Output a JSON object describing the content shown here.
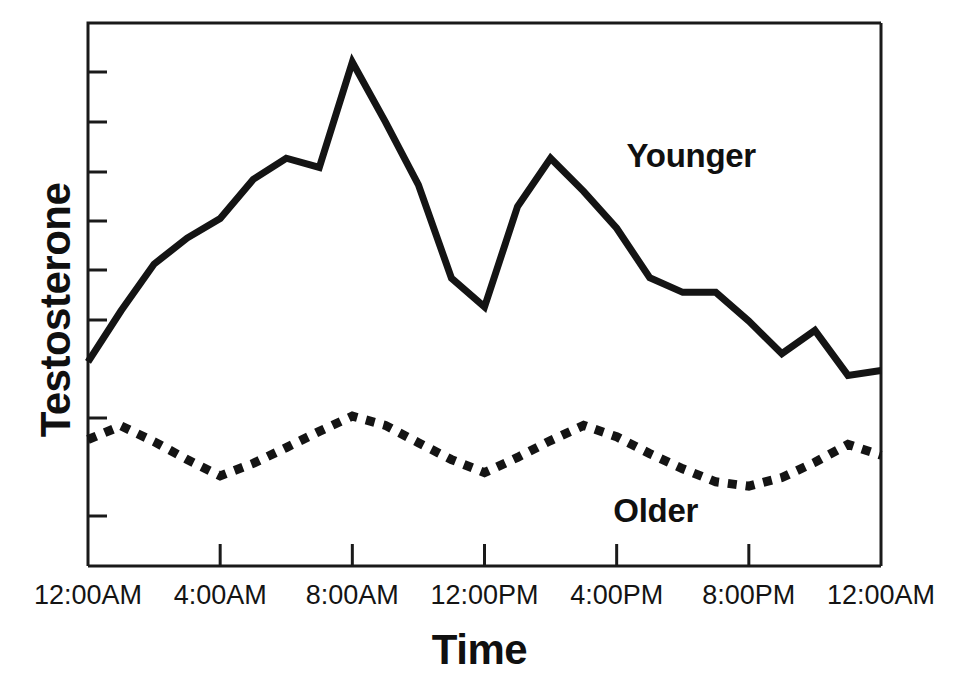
{
  "chart_data": {
    "type": "line",
    "title": "",
    "xlabel": "Time",
    "ylabel": "Testosterone",
    "grid": false,
    "legend_position": "inline-annotation",
    "x_tick_labels": [
      "12:00AM",
      "4:00AM",
      "8:00AM",
      "12:00PM",
      "4:00PM",
      "8:00PM",
      "12:00AM"
    ],
    "x_tick_hours": [
      0,
      4,
      8,
      12,
      16,
      20,
      24
    ],
    "xlim_hours": [
      0,
      24
    ],
    "y_axis_labeled": false,
    "y_tick_count": 8,
    "ylim": [
      0,
      1
    ],
    "series": [
      {
        "name": "Younger",
        "style": "solid",
        "color": "#141414",
        "x_hours": [
          0,
          1,
          2,
          3,
          4,
          5,
          6,
          7,
          8,
          9,
          10,
          11,
          12,
          13,
          14,
          15,
          16,
          17,
          18,
          19,
          20,
          21,
          22,
          23,
          24
        ],
        "values": [
          0.376,
          0.47,
          0.556,
          0.604,
          0.64,
          0.712,
          0.751,
          0.734,
          0.928,
          0.818,
          0.702,
          0.53,
          0.477,
          0.662,
          0.751,
          0.69,
          0.622,
          0.531,
          0.504,
          0.504,
          0.451,
          0.391,
          0.434,
          0.351,
          0.36
        ]
      },
      {
        "name": "Older",
        "style": "dotted",
        "color": "#141414",
        "x_hours": [
          0,
          1,
          2,
          3,
          4,
          5,
          6,
          7,
          8,
          9,
          10,
          11,
          12,
          13,
          14,
          15,
          16,
          17,
          18,
          19,
          20,
          21,
          22,
          23,
          24
        ],
        "values": [
          0.233,
          0.258,
          0.229,
          0.196,
          0.166,
          0.189,
          0.218,
          0.248,
          0.276,
          0.259,
          0.227,
          0.196,
          0.172,
          0.2,
          0.231,
          0.259,
          0.238,
          0.207,
          0.179,
          0.155,
          0.147,
          0.163,
          0.191,
          0.224,
          0.204
        ]
      }
    ],
    "annotations": [
      {
        "text": "Younger",
        "x_hours": 16.3,
        "value": 0.75
      },
      {
        "text": "Older",
        "x_hours": 15.9,
        "value": 0.095
      }
    ]
  },
  "figure": {
    "background_color": "#ffffff",
    "axis_color": "#1a1a1a",
    "series_color": "#141414"
  }
}
